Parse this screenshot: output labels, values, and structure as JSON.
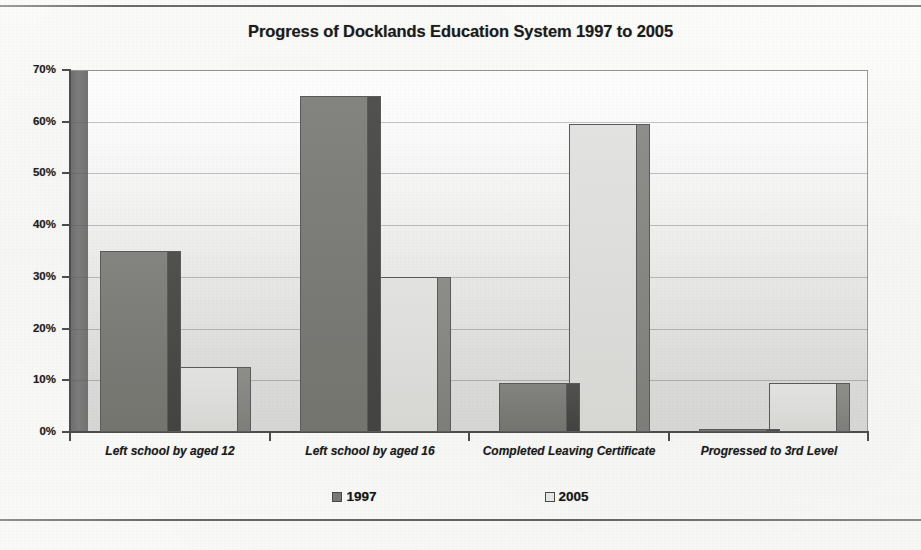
{
  "document": {
    "has_top_rule": true,
    "has_bottom_rule": true
  },
  "chart_data": {
    "type": "bar",
    "title": "Progress of Docklands Education System 1997 to 2005",
    "xlabel": "",
    "ylabel": "",
    "ylim": [
      0,
      70
    ],
    "y_tick_labels": [
      "0%",
      "10%",
      "20%",
      "30%",
      "40%",
      "50%",
      "60%",
      "70%"
    ],
    "y_tick_values": [
      0,
      10,
      20,
      30,
      40,
      50,
      60,
      70
    ],
    "grid": true,
    "legend_position": "bottom",
    "categories": [
      "Left school by aged 12",
      "Left school by aged 16",
      "Completed Leaving Certificate",
      "Progressed to 3rd Level"
    ],
    "series": [
      {
        "name": "1997",
        "color": "#7a7a76",
        "values": [
          35,
          65,
          9.5,
          0.5
        ]
      },
      {
        "name": "2005",
        "color": "#dcdcda",
        "values": [
          12.5,
          30,
          59.5,
          9.5
        ]
      }
    ]
  },
  "legend": {
    "items": [
      {
        "label": "1997"
      },
      {
        "label": "2005"
      }
    ]
  }
}
